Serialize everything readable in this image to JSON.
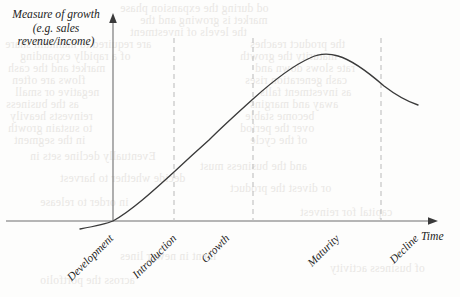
{
  "figure": {
    "y_axis_label": {
      "line1": "Measure of growth",
      "line2": "(e.g. sales",
      "line3": "revenue/income)"
    },
    "x_axis_label": "Time",
    "axis_color": "#6e6e6e",
    "curve_color": "#3a3a3a",
    "divider_color": "#b9b9b9",
    "background_color": "#fdfdfc",
    "bleed_color": "#e9e7e4"
  },
  "chart_data": {
    "type": "line",
    "title": "",
    "xlabel": "Time",
    "ylabel": "Measure of growth (e.g. sales revenue/income)",
    "grid": false,
    "legend": "none",
    "xlim": [
      0,
      100
    ],
    "ylim": [
      0,
      100
    ],
    "x_tick_labels": [
      "Development",
      "Introduction",
      "Growth",
      "Maturity",
      "Decline"
    ],
    "stage_boundaries": [
      19,
      43,
      82
    ],
    "annotation": "Product life cycle curve: growth rises slowly through development and introduction, accelerates through growth, peaks and flattens at maturity, then falls during decline.",
    "series": [
      {
        "name": "Product life cycle",
        "points": [
          {
            "x": -10,
            "y": -4
          },
          {
            "x": 0,
            "y": 0
          },
          {
            "x": 10,
            "y": 10
          },
          {
            "x": 19,
            "y": 20
          },
          {
            "x": 30,
            "y": 35
          },
          {
            "x": 38,
            "y": 45
          },
          {
            "x": 43,
            "y": 54
          },
          {
            "x": 55,
            "y": 72
          },
          {
            "x": 65,
            "y": 84
          },
          {
            "x": 75,
            "y": 92
          },
          {
            "x": 82,
            "y": 94
          },
          {
            "x": 90,
            "y": 90
          },
          {
            "x": 97,
            "y": 80
          },
          {
            "x": 100,
            "y": 71
          }
        ]
      }
    ]
  },
  "stages": [
    {
      "label": "Development",
      "anchor_x": 107,
      "anchor_y": 232
    },
    {
      "label": "Introduction",
      "anchor_x": 170,
      "anchor_y": 232
    },
    {
      "label": "Growth",
      "anchor_x": 223,
      "anchor_y": 232
    },
    {
      "label": "Maturity",
      "anchor_x": 333,
      "anchor_y": 232
    },
    {
      "label": "Decline",
      "anchor_x": 412,
      "anchor_y": 232
    }
  ],
  "bleed_lines": [
    {
      "x": 120,
      "y": 2,
      "text": "od during the expansion phase"
    },
    {
      "x": 140,
      "y": 14,
      "text": "market is growing and the"
    },
    {
      "x": 130,
      "y": 26,
      "text": "the levels of investment"
    },
    {
      "x": 5,
      "y": 38,
      "text": "are required to maintain share"
    },
    {
      "x": 20,
      "y": 50,
      "text": "of a rapidly expanding"
    },
    {
      "x": 8,
      "y": 62,
      "text": "market and the cash"
    },
    {
      "x": 12,
      "y": 74,
      "text": "flows are often"
    },
    {
      "x": 15,
      "y": 86,
      "text": "negative or small"
    },
    {
      "x": 6,
      "y": 98,
      "text": "as the business"
    },
    {
      "x": 10,
      "y": 110,
      "text": "reinvests heavily"
    },
    {
      "x": 8,
      "y": 122,
      "text": "to sustain growth"
    },
    {
      "x": 14,
      "y": 134,
      "text": "in the segment"
    },
    {
      "x": 250,
      "y": 38,
      "text": "the product reaches"
    },
    {
      "x": 240,
      "y": 50,
      "text": "maturity the growth"
    },
    {
      "x": 255,
      "y": 62,
      "text": "rate slows down and"
    },
    {
      "x": 245,
      "y": 74,
      "text": "cash generation rises"
    },
    {
      "x": 260,
      "y": 86,
      "text": "as investment falls"
    },
    {
      "x": 250,
      "y": 98,
      "text": "away and margins"
    },
    {
      "x": 245,
      "y": 110,
      "text": "become stable"
    },
    {
      "x": 240,
      "y": 122,
      "text": "over the period"
    },
    {
      "x": 250,
      "y": 134,
      "text": "of the cycle"
    },
    {
      "x": 30,
      "y": 150,
      "text": "Eventually decline sets in"
    },
    {
      "x": 200,
      "y": 160,
      "text": "and the business must"
    },
    {
      "x": 60,
      "y": 172,
      "text": "decide whether to harvest"
    },
    {
      "x": 230,
      "y": 182,
      "text": "or divest the product"
    },
    {
      "x": 40,
      "y": 196,
      "text": "in order to release"
    },
    {
      "x": 300,
      "y": 206,
      "text": "capital for reinvest"
    },
    {
      "x": 120,
      "y": 250,
      "text": "ment in newer lines"
    },
    {
      "x": 330,
      "y": 262,
      "text": "of business activity"
    },
    {
      "x": 40,
      "y": 274,
      "text": "across the portfolio"
    }
  ]
}
